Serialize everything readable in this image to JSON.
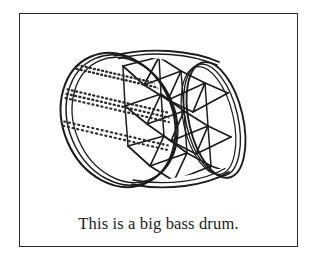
{
  "page": {
    "background_color": "#ffffff",
    "ink_color": "#1c1c1c"
  },
  "card": {
    "border_color": "#2a2a2a",
    "fill_color": "#ffffff"
  },
  "illustration": {
    "subject": "bass-drum",
    "description": "Line drawing of a big bass drum tilted on its side, viewed at an angle so the circular drum head faces the lower left and the cylindrical shell recedes to the upper right.",
    "line_color": "#1c1c1c",
    "fill_color": "#ffffff",
    "parts": [
      {
        "name": "drum-head",
        "label": "Drum head"
      },
      {
        "name": "drum-head-rim",
        "label": "Head counter hoop"
      },
      {
        "name": "drum-shell",
        "label": "Shell"
      },
      {
        "name": "far-rim",
        "label": "Far counter hoop"
      },
      {
        "name": "lacing-zigzag",
        "label": "Rope lacing zigzag"
      },
      {
        "name": "head-texture-dots",
        "label": "Stippled head texture"
      }
    ]
  },
  "caption": {
    "text": "This is a big bass drum."
  }
}
